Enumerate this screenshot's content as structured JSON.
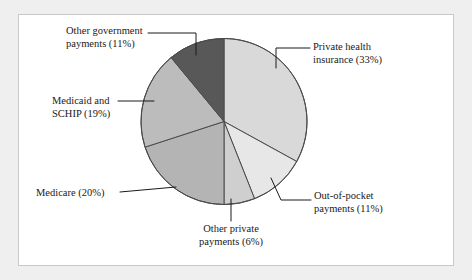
{
  "figure": {
    "background_color": "#efeff0",
    "panel_color": "#ffffff",
    "panel_border_color": "#c9c9c9"
  },
  "chart_data": {
    "type": "pie",
    "title": "",
    "subtitle": "",
    "xlabel": "",
    "ylabel": "",
    "legend_position": "none",
    "grid": false,
    "value_unit": "percent",
    "total": 100,
    "start_angle_deg": 0,
    "direction": "clockwise",
    "categories": [
      "Private health insurance",
      "Out-of-pocket payments",
      "Other private payments",
      "Medicare",
      "Medicaid and SCHIP",
      "Other government payments"
    ],
    "values": [
      33,
      11,
      6,
      20,
      19,
      11
    ],
    "slices": [
      {
        "name": "Private health insurance",
        "value": 33,
        "label": "Private health\ninsurance (33%)",
        "label_text": "Private health insurance (33%)",
        "color": "#d9d9d9",
        "start_deg": 0,
        "end_deg": 118.8
      },
      {
        "name": "Out-of-pocket payments",
        "value": 11,
        "label": "Out-of-pocket\npayments (11%)",
        "label_text": "Out-of-pocket payments (11%)",
        "color": "#e7e7e7",
        "start_deg": 118.8,
        "end_deg": 158.4
      },
      {
        "name": "Other private payments",
        "value": 6,
        "label": "Other private\npayments (6%)",
        "label_text": "Other private payments (6%)",
        "color": "#cfcfcf",
        "start_deg": 158.4,
        "end_deg": 180.0
      },
      {
        "name": "Medicare",
        "value": 20,
        "label": "Medicare (20%)",
        "label_text": "Medicare (20%)",
        "color": "#b4b4b4",
        "start_deg": 180.0,
        "end_deg": 252.0
      },
      {
        "name": "Medicaid and SCHIP",
        "value": 19,
        "label": "Medicaid and\nSCHIP (19%)",
        "label_text": "Medicaid and SCHIP (19%)",
        "color": "#bcbcbc",
        "start_deg": 252.0,
        "end_deg": 320.4
      },
      {
        "name": "Other government payments",
        "value": 11,
        "label": "Other government\npayments (11%)",
        "label_text": "Other government payments (11%)",
        "color": "#585858",
        "start_deg": 320.4,
        "end_deg": 360.0
      }
    ],
    "geometry": {
      "center_x": 224,
      "center_y": 121.5,
      "radius": 83,
      "outline_color": "#4a4a4a"
    }
  }
}
